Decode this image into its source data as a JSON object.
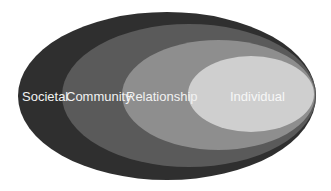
{
  "diagram": {
    "type": "nested-ellipses",
    "layers": [
      {
        "label": "Societal",
        "color": "#2f2f2f"
      },
      {
        "label": "Community",
        "color": "#5a5a5a"
      },
      {
        "label": "Relationship",
        "color": "#8e8e8e"
      },
      {
        "label": "Individual",
        "color": "#cfcfcf"
      }
    ]
  }
}
